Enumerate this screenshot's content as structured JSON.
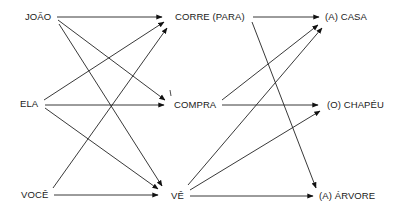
{
  "diagram": {
    "type": "word-combination-graph",
    "columns": {
      "subjects": [
        {
          "id": "joao",
          "label": "JOÃO"
        },
        {
          "id": "ela",
          "label": "ELA"
        },
        {
          "id": "voce",
          "label": "VOCÊ"
        }
      ],
      "verbs": [
        {
          "id": "corre",
          "label": "CORRE (PARA)"
        },
        {
          "id": "compra",
          "label": "COMPRA"
        },
        {
          "id": "ve",
          "label": "VÊ"
        }
      ],
      "objects": [
        {
          "id": "casa",
          "label": "(A) CASA"
        },
        {
          "id": "chapeu",
          "label": "(O) CHAPÉU"
        },
        {
          "id": "arvore",
          "label": "(A) ÁRVORE"
        }
      ]
    },
    "edges": [
      {
        "from": "joao",
        "to": "corre"
      },
      {
        "from": "joao",
        "to": "compra"
      },
      {
        "from": "joao",
        "to": "ve"
      },
      {
        "from": "ela",
        "to": "corre"
      },
      {
        "from": "ela",
        "to": "compra"
      },
      {
        "from": "ela",
        "to": "ve"
      },
      {
        "from": "voce",
        "to": "corre"
      },
      {
        "from": "voce",
        "to": "ve"
      },
      {
        "from": "corre",
        "to": "casa"
      },
      {
        "from": "corre",
        "to": "arvore"
      },
      {
        "from": "compra",
        "to": "casa"
      },
      {
        "from": "compra",
        "to": "chapeu"
      },
      {
        "from": "ve",
        "to": "casa"
      },
      {
        "from": "ve",
        "to": "chapeu"
      },
      {
        "from": "ve",
        "to": "arvore"
      }
    ],
    "annotation_mark": "/"
  }
}
